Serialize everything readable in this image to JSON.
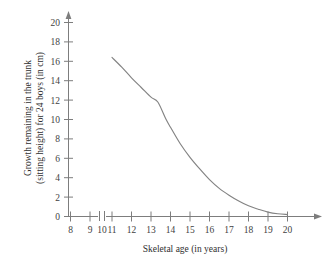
{
  "chart_data": {
    "type": "line",
    "title": "",
    "xlabel": "Skeletal age (in years)",
    "ylabel_line1": "Growth remaining in the trunk",
    "ylabel_line2": "(sitting height) for 24 boys (in cm)",
    "xlim": [
      8,
      20
    ],
    "ylim": [
      0,
      20
    ],
    "x_ticks": [
      8,
      9,
      10,
      11,
      12,
      13,
      14,
      15,
      16,
      17,
      18,
      19,
      20
    ],
    "y_ticks": [
      0,
      2,
      4,
      6,
      8,
      10,
      12,
      14,
      16,
      18,
      20
    ],
    "x_tick_labels": [
      "8",
      "9",
      "10",
      "11",
      "12",
      "13",
      "14",
      "15",
      "16",
      "17",
      "18",
      "19",
      "20"
    ],
    "y_tick_labels": [
      "0",
      "2",
      "4",
      "6",
      "8",
      "10",
      "12",
      "14",
      "16",
      "18",
      "20"
    ],
    "axis_break_between": [
      9,
      10
    ],
    "grid": false,
    "legend": "none",
    "series": [
      {
        "name": "Growth remaining in trunk",
        "color": "#838383",
        "x": [
          11.0,
          11.5,
          12.0,
          12.5,
          13.0,
          13.35,
          13.75,
          14.0,
          14.5,
          15.0,
          15.5,
          16.0,
          16.5,
          17.0,
          17.5,
          18.0,
          18.5,
          19.0,
          19.5,
          20.0
        ],
        "values": [
          16.4,
          15.4,
          14.3,
          13.3,
          12.3,
          11.8,
          10.1,
          9.2,
          7.5,
          6.1,
          4.9,
          3.8,
          2.9,
          2.2,
          1.6,
          1.1,
          0.75,
          0.45,
          0.28,
          0.2
        ]
      }
    ]
  },
  "colors": {
    "axis": "#7d7d7d",
    "curve": "#838383",
    "text": "#3a3a3a",
    "background": "#ffffff"
  }
}
